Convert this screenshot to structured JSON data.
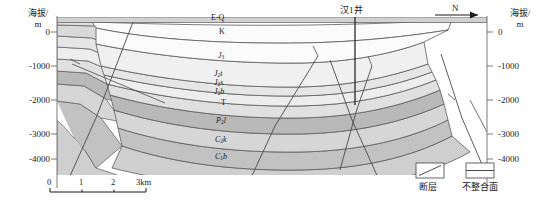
{
  "figure": {
    "type": "geological-cross-section",
    "orientation_marker": "N"
  },
  "axes": {
    "left": {
      "title": "海拔/",
      "unit": "m",
      "ticks": [
        "0",
        "-1000",
        "-2000",
        "-3000",
        "-4000"
      ]
    },
    "right": {
      "title": "海拔/",
      "unit": "m",
      "ticks": [
        "0",
        "-1000",
        "-2000",
        "-3000",
        "-4000"
      ]
    }
  },
  "well": {
    "name": "汉1井"
  },
  "strata": [
    {
      "code": "E-Q",
      "base": "E-Q",
      "sub": "",
      "color": "#c8c8c8"
    },
    {
      "code": "K",
      "base": "K",
      "sub": "",
      "color": "#fbfbfb"
    },
    {
      "code": "J3",
      "base": "J",
      "sub": "3",
      "color": "#f0f0f0"
    },
    {
      "code": "J2t",
      "base": "J",
      "sub": "2",
      "suffix": "t",
      "color": "#e6e6e6"
    },
    {
      "code": "J2s",
      "base": "J",
      "sub": "2",
      "suffix": "s",
      "color": "#ededed"
    },
    {
      "code": "J2b",
      "base": "J",
      "sub": "2",
      "suffix": "b",
      "color": "#e0e0e0"
    },
    {
      "code": "T",
      "base": "T",
      "sub": "",
      "color": "#b9b9b9"
    },
    {
      "code": "P2l",
      "base": "P",
      "sub": "2",
      "suffix": "l",
      "color": "#d6d6d6"
    },
    {
      "code": "C2k",
      "base": "C",
      "sub": "2",
      "suffix": "k",
      "color": "#c2c2c2"
    },
    {
      "code": "C1b",
      "base": "C",
      "sub": "1",
      "suffix": "b",
      "color": "#cfcfcf"
    }
  ],
  "legend": {
    "items": [
      {
        "label": "断层",
        "symbol": "fault"
      },
      {
        "label": "不整合面",
        "symbol": "unconformity"
      }
    ]
  },
  "scalebar": {
    "ticks": [
      "0",
      "1",
      "2",
      "3km"
    ]
  },
  "colors": {
    "line": "#5a5a5a",
    "frame": "#7a7a7a",
    "text": "#1a1a1a"
  }
}
